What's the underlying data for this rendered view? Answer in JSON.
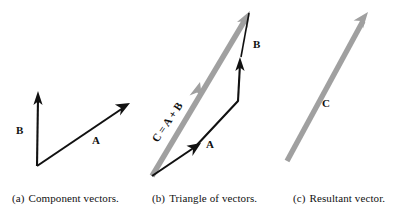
{
  "figure": {
    "width": 403,
    "height": 212,
    "background": "#ffffff",
    "black": "#111111",
    "gray": "#a0a0a0"
  },
  "panels": [
    {
      "id": "a",
      "tag": "(a)",
      "caption": "Component vectors.",
      "vectors": [
        {
          "name": "B",
          "label": "B",
          "color": "#111111",
          "from": [
            37,
            166
          ],
          "to": [
            38,
            93
          ]
        },
        {
          "name": "A",
          "label": "A",
          "color": "#111111",
          "from": [
            37,
            166
          ],
          "to": [
            129,
            104
          ]
        }
      ]
    },
    {
      "id": "b",
      "tag": "(b)",
      "caption": "Triangle of vectors.",
      "vectors": [
        {
          "name": "C",
          "label": "C = A + B",
          "color": "#a0a0a0",
          "from": [
            152,
            176
          ],
          "to": [
            250,
            11
          ]
        },
        {
          "name": "A",
          "label": "A",
          "color": "#111111",
          "from": [
            152,
            176
          ],
          "to": [
            200,
            144
          ]
        },
        {
          "name": "B",
          "label": "B",
          "color": "#111111",
          "from": [
            238,
            101
          ],
          "to": [
            240,
            58
          ]
        }
      ]
    },
    {
      "id": "c",
      "tag": "(c)",
      "caption": "Resultant vector.",
      "vectors": [
        {
          "name": "C",
          "label": "C",
          "color": "#a0a0a0",
          "from": [
            287,
            161
          ],
          "to": [
            368,
            12
          ]
        }
      ]
    }
  ],
  "labels": {
    "a_B": "B",
    "a_A": "A",
    "b_C": "C = A + B",
    "b_A": "A",
    "b_B": "B",
    "c_C": "C"
  },
  "captions": {
    "a_tag": "(a)",
    "a_text": "Component vectors.",
    "b_tag": "(b)",
    "b_text": "Triangle of vectors.",
    "c_tag": "(c)",
    "c_text": "Resultant vector."
  }
}
